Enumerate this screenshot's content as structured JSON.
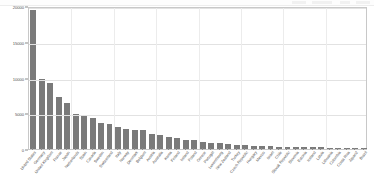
{
  "toolbar": {
    "present": true
  },
  "chart_data": {
    "type": "bar",
    "title": "",
    "subtitle": "",
    "xlabel": "",
    "ylabel": "",
    "ylim": [
      0,
      20000
    ],
    "yticks": [
      0,
      5000,
      10000,
      15000,
      20000
    ],
    "ytick_labels": [
      "0",
      "5000",
      "10000",
      "15000",
      "20000"
    ],
    "grid": true,
    "legend": "none",
    "orientation": "vertical",
    "bar_color": "#7a7a7a",
    "categories": [
      "United States",
      "Germany",
      "United Kingdom",
      "France",
      "Japan",
      "Netherlands",
      "Spain",
      "Canada",
      "Sweden",
      "Switzerland",
      "Italy",
      "Norway",
      "Denmark",
      "Belgium",
      "Austria",
      "Australia",
      "Korea",
      "Finland",
      "Ireland",
      "Poland",
      "Greece",
      "Portugal",
      "Luxembourg",
      "New Zealand",
      "Turkey",
      "Czech Republic",
      "Hungary",
      "Mexico",
      "Israel",
      "Chile",
      "Slovak Republic",
      "Slovenia",
      "Estonia",
      "Iceland",
      "Latvia",
      "Lithuania",
      "Colombia",
      "Costa Rica",
      "Japan2",
      "Brazil"
    ],
    "values": [
      19500,
      9800,
      9200,
      7300,
      6400,
      4900,
      4550,
      4350,
      3700,
      3550,
      3050,
      2750,
      2700,
      2650,
      2150,
      1900,
      1650,
      1500,
      1300,
      1200,
      1000,
      900,
      800,
      700,
      600,
      520,
      450,
      400,
      360,
      330,
      300,
      280,
      255,
      235,
      215,
      195,
      180,
      165,
      150,
      140
    ]
  }
}
